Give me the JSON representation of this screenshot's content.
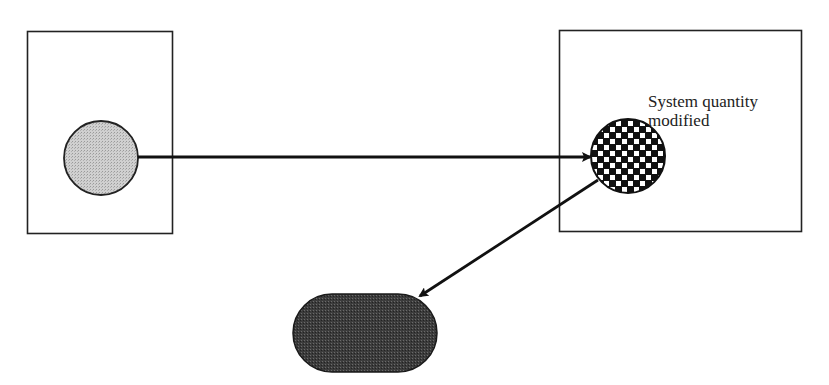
{
  "diagram": {
    "nodes": [
      {
        "id": "source-box",
        "shape": "rectangle",
        "fill": "#ffffff",
        "stroke": "#222222"
      },
      {
        "id": "source-circle",
        "shape": "circle",
        "fill": "#c8c8c8",
        "pattern": "stipple"
      },
      {
        "id": "target-box",
        "shape": "rectangle",
        "fill": "#ffffff",
        "stroke": "#222222"
      },
      {
        "id": "modified-circle",
        "shape": "circle",
        "pattern": "checkerboard",
        "colors": [
          "#111111",
          "#ffffff"
        ]
      },
      {
        "id": "result-pill",
        "shape": "stadium",
        "fill": "#3a3a3a",
        "pattern": "dense-stipple"
      }
    ],
    "edges": [
      {
        "from": "source-circle",
        "to": "modified-circle",
        "style": "arrow"
      },
      {
        "from": "modified-circle",
        "to": "result-pill",
        "style": "arrow"
      }
    ],
    "labels": {
      "target_line1": "System quantity",
      "target_line2": "modified"
    }
  }
}
